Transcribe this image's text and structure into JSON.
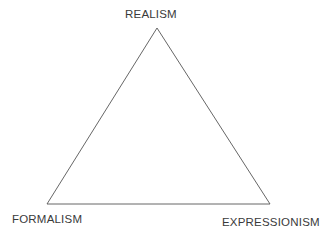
{
  "diagram": {
    "type": "triangle",
    "vertices": {
      "top": {
        "label": "REALISM",
        "x": 157,
        "y": 28
      },
      "bottom_left": {
        "label": "FORMALISM",
        "x": 47,
        "y": 204
      },
      "bottom_right": {
        "label": "EXPRESSIONISM",
        "x": 270,
        "y": 204
      }
    },
    "line_color": "#555555",
    "text_color": "#3a3a3a"
  }
}
